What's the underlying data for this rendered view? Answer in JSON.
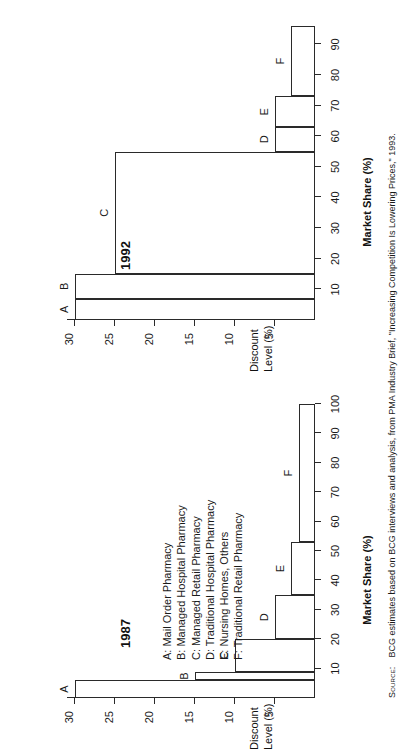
{
  "figure": {
    "y_axis_title_line1": "Discount",
    "y_axis_title_line2": "Level (%)",
    "x_axis_title": "Market Share (%)",
    "y_ticks": [
      30,
      25,
      20,
      15,
      10,
      5
    ],
    "x_ticks_1987": [
      10,
      20,
      30,
      40,
      50,
      60,
      70,
      80,
      90,
      100
    ],
    "x_ticks_1992": [
      10,
      20,
      30,
      40,
      50,
      60,
      70,
      80,
      90
    ]
  },
  "legend": {
    "items": [
      "A: Mail Order Pharmacy",
      "B: Managed Hospital Pharmacy",
      "C: Managed Retail Pharmacy",
      "D: Traditional Hospital Pharmacy",
      "E: Nursing Homes, Others",
      "F: Traditional Retail Pharmacy"
    ]
  },
  "source": {
    "label": "Source:",
    "text": "BCG estimates based on BCG interviews and analysis, from PMA Industry Brief, \"Increasing Competition Is Lowering Prices,\" 1993."
  },
  "chart_data": [
    {
      "type": "bar",
      "title": "1987",
      "xlabel": "Market Share (%)",
      "ylabel": "Discount Level (%)",
      "xlim": [
        0,
        100
      ],
      "ylim": [
        0,
        31
      ],
      "grid": false,
      "note": "Staircase / marimekko: each segment spans a market-share range on x and its height is the discount level.",
      "categories": [
        "A",
        "B",
        "C",
        "D",
        "E",
        "F"
      ],
      "segments": [
        {
          "label": "A",
          "name": "Mail Order Pharmacy",
          "x_start": 0,
          "x_end": 6,
          "share": 6,
          "discount": 30
        },
        {
          "label": "B",
          "name": "Managed Hospital Pharmacy",
          "x_start": 6,
          "x_end": 9,
          "share": 3,
          "discount": 15
        },
        {
          "label": "C",
          "name": "Managed Retail Pharmacy",
          "x_start": 9,
          "x_end": 20,
          "share": 11,
          "discount": 10
        },
        {
          "label": "D",
          "name": "Traditional Hospital Pharmacy",
          "x_start": 20,
          "x_end": 35,
          "share": 15,
          "discount": 5
        },
        {
          "label": "E",
          "name": "Nursing Homes, Others",
          "x_start": 35,
          "x_end": 53,
          "share": 18,
          "discount": 3
        },
        {
          "label": "F",
          "name": "Traditional Retail Pharmacy",
          "x_start": 53,
          "x_end": 100,
          "share": 47,
          "discount": 2
        }
      ]
    },
    {
      "type": "bar",
      "title": "1992",
      "xlabel": "Market Share (%)",
      "ylabel": "Discount Level (%)",
      "xlim": [
        0,
        96
      ],
      "ylim": [
        0,
        31
      ],
      "grid": false,
      "note": "Staircase / marimekko: each segment spans a market-share range on x and its height is the discount level. Right edge is cropped in the scan.",
      "categories": [
        "A",
        "B",
        "C",
        "D",
        "E",
        "F"
      ],
      "segments": [
        {
          "label": "A",
          "name": "Mail Order Pharmacy",
          "x_start": 0,
          "x_end": 7,
          "share": 7,
          "discount": 30
        },
        {
          "label": "B",
          "name": "Managed Hospital Pharmacy",
          "x_start": 7,
          "x_end": 15,
          "share": 8,
          "discount": 30
        },
        {
          "label": "C",
          "name": "Managed Retail Pharmacy",
          "x_start": 15,
          "x_end": 55,
          "share": 40,
          "discount": 25
        },
        {
          "label": "D",
          "name": "Traditional Hospital Pharmacy",
          "x_start": 55,
          "x_end": 63,
          "share": 8,
          "discount": 5
        },
        {
          "label": "E",
          "name": "Nursing Homes, Others",
          "x_start": 63,
          "x_end": 73,
          "share": 10,
          "discount": 5
        },
        {
          "label": "F",
          "name": "Traditional Retail Pharmacy",
          "x_start": 73,
          "x_end": 96,
          "share": 23,
          "discount": 3
        }
      ]
    }
  ]
}
